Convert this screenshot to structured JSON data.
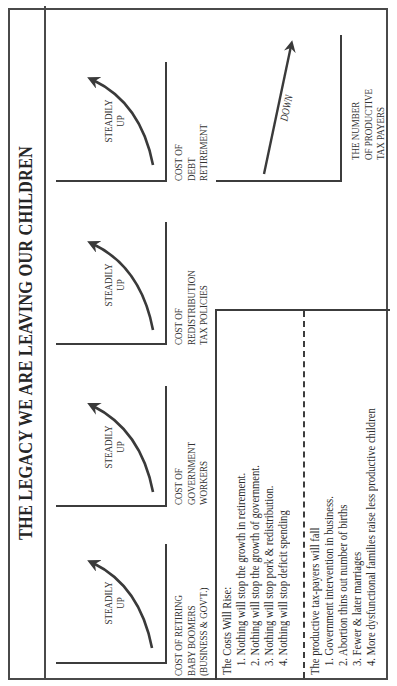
{
  "title": "THE LEGACY WE ARE LEAVING OUR CHILDREN",
  "orientation": "rotated-90-ccw",
  "colors": {
    "ink": "#3c3c3c",
    "paper": "#ffffff"
  },
  "charts": [
    {
      "trend": "STEADILY UP",
      "trend_line1": "STEADILY",
      "trend_line2": "UP",
      "label_lines": [
        "COST OF RETIRING",
        "BABY BOOMERS",
        "(BUSINESS & GOV'T.)"
      ],
      "arrow": "curved-up-arrow"
    },
    {
      "trend": "STEADILY UP",
      "trend_line1": "STEADILY",
      "trend_line2": "UP",
      "label_lines": [
        "COST OF",
        "GOVERNMENT",
        "WORKERS"
      ],
      "arrow": "curved-up-arrow"
    },
    {
      "trend": "STEADILY UP",
      "trend_line1": "STEADILY",
      "trend_line2": "UP",
      "label_lines": [
        "COST OF",
        "REDISTRIBUTION",
        "TAX POLICIES"
      ],
      "arrow": "curved-up-arrow"
    },
    {
      "trend": "STEADILY UP",
      "trend_line1": "STEADILY",
      "trend_line2": "UP",
      "label_lines": [
        "COST OF",
        "DEBT",
        "RETIREMENT"
      ],
      "arrow": "curved-up-arrow"
    },
    {
      "trend": "DOWN",
      "trend_line1": "DOWN",
      "label_lines": [
        "THE NUMBER",
        "OF PRODUCTIVE",
        "TAX PAYERS"
      ],
      "arrow": "straight-arrow"
    }
  ],
  "costs_block": {
    "heading": "The Costs Will Rise:",
    "items": [
      "1. Nothing will stop the growth in retirement.",
      "2. Nothing will stop the growth of government.",
      "3. Nothing will stop pork & redistribution.",
      "4. Nothing will stop deficit spending"
    ]
  },
  "taxpayers_block": {
    "heading": "The productive tax-payers will fall",
    "items": [
      "1. Government intervention in business.",
      "2. Abortion thins out number of births",
      "3. Fewer & later marriages",
      "4. More dysfunctional families raise less productive children"
    ]
  }
}
